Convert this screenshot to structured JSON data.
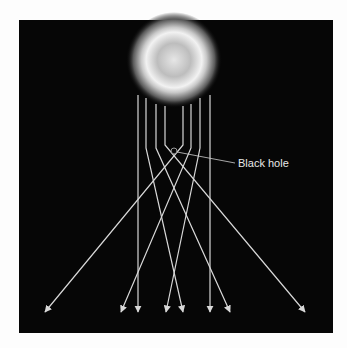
{
  "diagram": {
    "type": "gravitational-lensing",
    "label": "Black hole",
    "colors": {
      "background": "#fdfdfd",
      "panel": "#060606",
      "rays": "#d8d8d8",
      "source_glow": "#ffffff"
    },
    "source": {
      "cx": 174,
      "cy": 60,
      "r": 46
    },
    "black_hole": {
      "cx": 174,
      "cy": 151,
      "r": 3
    },
    "rays": [
      {
        "points": [
          [
            138,
            95
          ],
          [
            138,
            312
          ]
        ]
      },
      {
        "points": [
          [
            146,
            98
          ],
          [
            146,
            148
          ],
          [
            183,
            312
          ]
        ]
      },
      {
        "points": [
          [
            156,
            104
          ],
          [
            156,
            148
          ],
          [
            230,
            312
          ]
        ]
      },
      {
        "points": [
          [
            165,
            106
          ],
          [
            165,
            145
          ],
          [
            305,
            312
          ]
        ]
      },
      {
        "points": [
          [
            183,
            106
          ],
          [
            183,
            145
          ],
          [
            45,
            312
          ]
        ]
      },
      {
        "points": [
          [
            191,
            104
          ],
          [
            191,
            148
          ],
          [
            121,
            312
          ]
        ]
      },
      {
        "points": [
          [
            200,
            98
          ],
          [
            200,
            148
          ],
          [
            166,
            312
          ]
        ]
      },
      {
        "points": [
          [
            210,
            95
          ],
          [
            210,
            312
          ]
        ]
      }
    ]
  }
}
